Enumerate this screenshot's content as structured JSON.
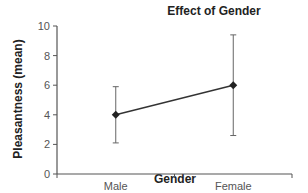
{
  "chart_data": {
    "type": "line",
    "title": "Effect of Gender",
    "xlabel": "Gender",
    "ylabel": "Pleasantness (mean)",
    "categories": [
      "Male",
      "Female"
    ],
    "series": [
      {
        "name": "Pleasantness (mean)",
        "values": [
          4,
          6
        ],
        "error_low": [
          2.1,
          2.6
        ],
        "error_high": [
          5.9,
          9.4
        ],
        "marker": "diamond"
      }
    ],
    "ylim": [
      0,
      10
    ],
    "yticks": [
      0,
      2,
      4,
      6,
      8,
      10
    ],
    "grid": false,
    "legend": null
  },
  "colors": {
    "line": "#333333",
    "axis": "#555555"
  }
}
